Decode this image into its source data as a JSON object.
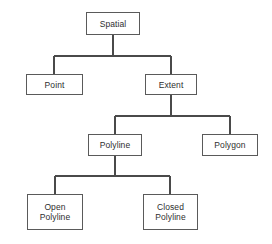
{
  "diagram": {
    "type": "tree",
    "background_color": "#ffffff",
    "line_color": "#4a4a4a",
    "box_border_color": "#5a5a5a",
    "box_fill_color": "#ffffff",
    "text_color": "#2e2e2e",
    "nodes": [
      {
        "id": "spatial",
        "label": "Spatial"
      },
      {
        "id": "point",
        "label": "Point"
      },
      {
        "id": "extent",
        "label": "Extent"
      },
      {
        "id": "polyline",
        "label": "Polyline"
      },
      {
        "id": "polygon",
        "label": "Polygon"
      },
      {
        "id": "open",
        "label": "Open\nPolyline"
      },
      {
        "id": "closed",
        "label": "Closed\nPolyline"
      }
    ],
    "edges": [
      {
        "from": "spatial",
        "to": "point"
      },
      {
        "from": "spatial",
        "to": "extent"
      },
      {
        "from": "extent",
        "to": "polyline"
      },
      {
        "from": "extent",
        "to": "polygon"
      },
      {
        "from": "polyline",
        "to": "open"
      },
      {
        "from": "polyline",
        "to": "closed"
      }
    ]
  }
}
